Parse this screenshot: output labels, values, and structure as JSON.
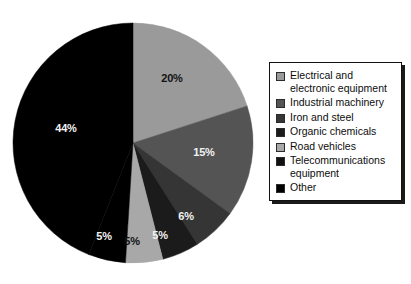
{
  "chart_data": {
    "type": "pie",
    "title": "",
    "legend_position": "right",
    "grid": false,
    "categories": [
      "Electrical and electronic equipment",
      "Industrial machinery",
      "Iron and steel",
      "Organic chemicals",
      "Road vehicles",
      "Telecommunications equipment",
      "Other"
    ],
    "values": [
      20,
      15,
      6,
      5,
      5,
      5,
      44
    ],
    "value_labels": [
      "20%",
      "15%",
      "6%",
      "5%",
      "5%",
      "5%",
      "44%"
    ],
    "units": "percent",
    "total": 100,
    "slice_colors": [
      "#9a9a9a",
      "#545454",
      "#353535",
      "#1b1b1b",
      "#a8a8a8",
      "#000000",
      "#000000"
    ],
    "start_angle_deg": 0,
    "direction": "clockwise"
  },
  "pie": {
    "center_x": 133,
    "center_y": 143,
    "radius": 120,
    "slices": [
      {
        "name": "electrical-and-electronic-equipment",
        "label": "20%",
        "value": 20,
        "color": "#9a9a9a",
        "label_color": "#121212",
        "label_x": 172,
        "label_y": 82
      },
      {
        "name": "industrial-machinery",
        "label": "15%",
        "value": 15,
        "color": "#545454",
        "label_color": "#f2f2f2",
        "label_x": 204,
        "label_y": 156
      },
      {
        "name": "iron-and-steel",
        "label": "6%",
        "value": 6,
        "color": "#353535",
        "label_color": "#f2f2f2",
        "label_x": 186,
        "label_y": 220
      },
      {
        "name": "organic-chemicals",
        "label": "5%",
        "value": 5,
        "color": "#1b1b1b",
        "label_color": "#f2f2f2",
        "label_x": 160,
        "label_y": 239
      },
      {
        "name": "road-vehicles",
        "label": "5%",
        "value": 5,
        "color": "#a8a8a8",
        "label_color": "#121212",
        "label_x": 132,
        "label_y": 245
      },
      {
        "name": "telecommunications-equipment",
        "label": "5%",
        "value": 5,
        "color": "#000000",
        "label_color": "#f2f2f2",
        "label_x": 104,
        "label_y": 240
      },
      {
        "name": "other",
        "label": "44%",
        "value": 44,
        "color": "#000000",
        "label_color": "#f2f2f2",
        "label_x": 66,
        "label_y": 132
      }
    ]
  },
  "legend": {
    "items": [
      {
        "label": "Electrical and\nelectronic equipment",
        "color": "#9a9a9a",
        "name": "legend-item-electrical-and-electronic-equipment"
      },
      {
        "label": "Industrial machinery",
        "color": "#545454",
        "name": "legend-item-industrial-machinery"
      },
      {
        "label": "Iron and steel",
        "color": "#353535",
        "name": "legend-item-iron-and-steel"
      },
      {
        "label": "Organic chemicals",
        "color": "#1b1b1b",
        "name": "legend-item-organic-chemicals"
      },
      {
        "label": "Road vehicles",
        "color": "#a8a8a8",
        "name": "legend-item-road-vehicles"
      },
      {
        "label": "Telecommunications\nequipment",
        "color": "#111111",
        "name": "legend-item-telecommunications-equipment"
      },
      {
        "label": "Other",
        "color": "#000000",
        "name": "legend-item-other"
      }
    ]
  }
}
